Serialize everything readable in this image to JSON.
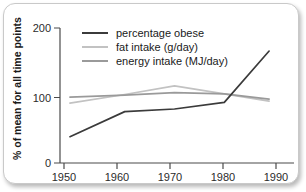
{
  "chart_data": {
    "type": "line",
    "title": "",
    "xlabel": "",
    "ylabel": "% of mean for all time points",
    "xlim": [
      1948,
      1995
    ],
    "ylim": [
      0,
      205
    ],
    "xticks": [
      1950,
      1960,
      1970,
      1980,
      1990
    ],
    "yticks": [
      0,
      100,
      200
    ],
    "grid": false,
    "legend_position": "top-center",
    "series": [
      {
        "name": "percentage obese",
        "color": "#3b3b3b",
        "x": [
          1950,
          1961,
          1971,
          1981,
          1990
        ],
        "values": [
          40,
          78,
          82,
          92,
          170
        ]
      },
      {
        "name": "fat intake (g/day)",
        "color": "#c2c2c2",
        "x": [
          1950,
          1961,
          1971,
          1981,
          1990
        ],
        "values": [
          91,
          104,
          117,
          105,
          94
        ]
      },
      {
        "name": "energy intake (MJ/day)",
        "color": "#9a9a9a",
        "x": [
          1950,
          1961,
          1971,
          1981,
          1990
        ],
        "values": [
          100,
          103,
          107,
          105,
          97
        ]
      }
    ]
  },
  "axes": {
    "y_title": "% of mean for all time points",
    "y_tick_labels": [
      "200",
      "100",
      "0"
    ],
    "x_tick_labels": [
      "1950",
      "1960",
      "1970",
      "1980",
      "1990"
    ]
  },
  "legend": {
    "entries": [
      {
        "label": "percentage obese",
        "color": "#3b3b3b"
      },
      {
        "label": "fat intake (g/day)",
        "color": "#c2c2c2"
      },
      {
        "label": "energy intake (MJ/day)",
        "color": "#9a9a9a"
      }
    ]
  },
  "colors": {
    "card_background": "#ffffff",
    "card_border": "#c9c9c9",
    "axis": "#4a4a4a",
    "text": "#1a1a1a"
  }
}
